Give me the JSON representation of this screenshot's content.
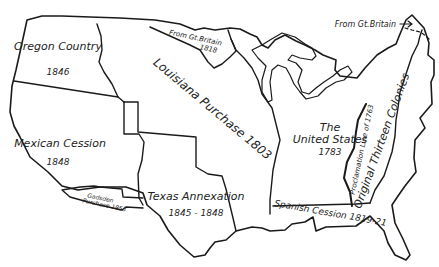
{
  "map": {
    "title": "",
    "regions": [
      {
        "id": "oregon",
        "name": "Oregon Country",
        "year": "1846"
      },
      {
        "id": "mexican",
        "name": "Mexican Cession",
        "year": "1848"
      },
      {
        "id": "gadsden",
        "name": "Gadsden",
        "name2": "Purchase 1853"
      },
      {
        "id": "texas",
        "name": "Texas Annexation",
        "year": "1845 - 1848"
      },
      {
        "id": "louisiana",
        "name": "Louisiana Purchase 1803"
      },
      {
        "id": "gb1818",
        "name": "From Gt.Britain",
        "year": "1818"
      },
      {
        "id": "us1783",
        "name": "The",
        "name2": "United States",
        "year": "1783"
      },
      {
        "id": "proclamation",
        "name": "Proclamation Line of 1763"
      },
      {
        "id": "colonies",
        "name": "Original Thirteen Colonies"
      },
      {
        "id": "spanish",
        "name": "Spanish Cession 1819-21"
      },
      {
        "id": "gbmaine",
        "name": "From Gt.Britain"
      }
    ],
    "colors": {
      "background": "#ffffff",
      "ink": "#1a1a1a"
    }
  }
}
